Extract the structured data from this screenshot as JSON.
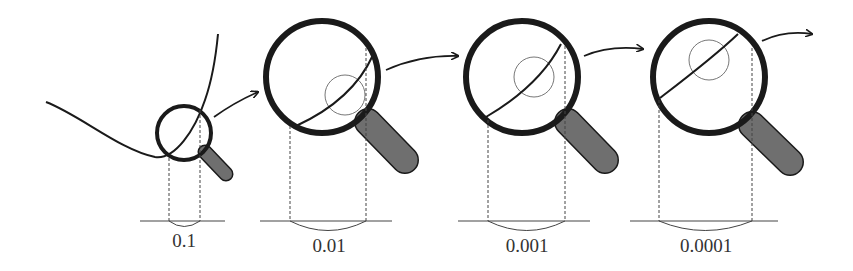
{
  "diagram": {
    "colors": {
      "stroke": "#1a1a1a",
      "handle_fill": "#6f6f6f",
      "thin_circle": "#777777",
      "dashed": "#444444"
    },
    "panels": [
      {
        "id": "panel-1",
        "interval_label": "0.1"
      },
      {
        "id": "panel-2",
        "interval_label": "0.01"
      },
      {
        "id": "panel-3",
        "interval_label": "0.001"
      },
      {
        "id": "panel-4",
        "interval_label": "0.0001"
      }
    ]
  }
}
